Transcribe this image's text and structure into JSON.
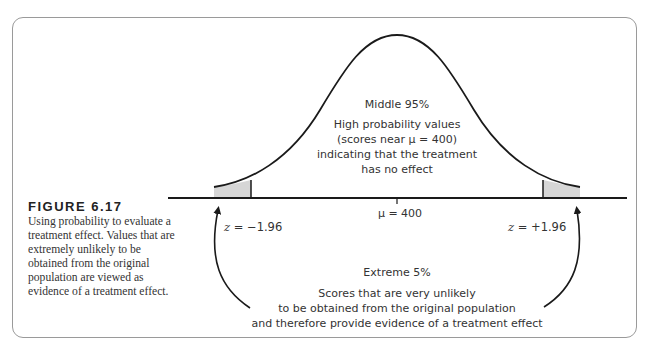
{
  "figure": {
    "label": "FIGURE 6.17",
    "caption": "Using probability to evaluate a treatment effect. Values that are extremely unlikely to be obtained from the original population are viewed as evidence of a treatment effect."
  },
  "middle_region": {
    "title": "Middle 95%",
    "line1": "High probability values",
    "line2": "(scores near μ = 400)",
    "line3": "indicating that the treatment",
    "line4": "has no effect"
  },
  "axis": {
    "mean_label": "μ = 400",
    "z_left_var": "z",
    "z_left_value": " = −1.96",
    "z_right_var": "z",
    "z_right_value": " = +1.96"
  },
  "extreme_region": {
    "title": "Extreme 5%",
    "line1": "Scores that are very unlikely",
    "line2": "to be obtained from the original population",
    "line3": "and therefore provide evidence of a treatment effect"
  },
  "colors": {
    "tail_fill": "#d6d6d6",
    "curve": "#1a1a1a",
    "frame": "#9a9a9a"
  }
}
